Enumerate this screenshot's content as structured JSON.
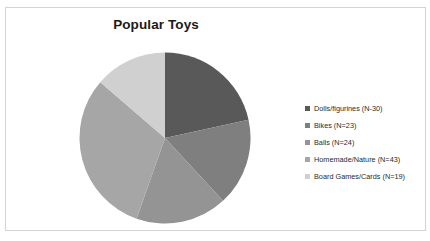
{
  "chart_data": {
    "type": "pie",
    "title": "Popular Toys",
    "xlabel": "",
    "ylabel": "",
    "legend_position": "right",
    "grid": false,
    "categories": [
      "Dolls/figurines",
      "Bikes",
      "Balls",
      "Homemade/Nature",
      "Board Games/Cards"
    ],
    "values": [
      30,
      23,
      24,
      43,
      19
    ],
    "total": 139,
    "legend_labels": [
      "Dolls/figurines (N-30)",
      "Bikes (N=23)",
      "Balls (N=24)",
      "Homemade/Nature (N=43)",
      "Board Games/Cards (N=19)"
    ],
    "slice_colors": [
      "#595959",
      "#7f7f7f",
      "#949494",
      "#a6a6a6",
      "#d0d0d0"
    ],
    "start_angle_deg": 0,
    "direction": "clockwise"
  },
  "frame": {
    "border_color": "#d4d4d4",
    "background": "#ffffff"
  }
}
